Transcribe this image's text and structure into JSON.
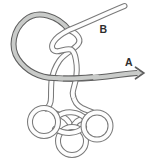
{
  "diagram": {
    "labels": {
      "a": "A",
      "b": "B"
    },
    "icons": {
      "arrow": "arrow-right"
    },
    "colors": {
      "background": "#ffffff",
      "rope_fill": "#fdfdfd",
      "rope_outline": "#7a7a7a",
      "shaded_rope_fill": "#c9cbc9",
      "shaded_rope_outline": "#5f5f5f",
      "label_text": "#2e2e2e"
    }
  }
}
